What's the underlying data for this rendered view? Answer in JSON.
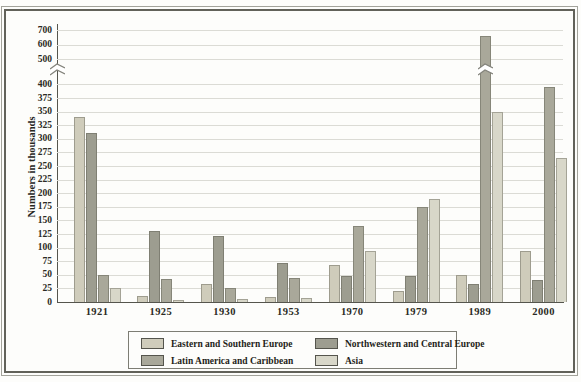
{
  "figure": {
    "ylabel": "Numbers in thousands"
  },
  "chart_data": {
    "type": "bar",
    "title": "",
    "xlabel": "",
    "ylabel": "Numbers in thousands",
    "categories": [
      "1921",
      "1925",
      "1930",
      "1953",
      "1970",
      "1979",
      "1989",
      "2000"
    ],
    "series": [
      {
        "name": "Eastern and Southern Europe",
        "color": "#cfccbb",
        "values": [
          340,
          12,
          34,
          10,
          68,
          20,
          50,
          93
        ]
      },
      {
        "name": "Northwestern and Central Europe",
        "color": "#9d9d90",
        "values": [
          311,
          130,
          121,
          72,
          48,
          48,
          33,
          40
        ]
      },
      {
        "name": "Latin America and Caribbean",
        "color": "#a9a89a",
        "values": [
          50,
          42,
          25,
          44,
          140,
          175,
          660,
          395
        ]
      },
      {
        "name": "Asia",
        "color": "#d8d7c9",
        "values": [
          25,
          4,
          5,
          8,
          94,
          190,
          350,
          265
        ]
      }
    ],
    "y_axis": {
      "ticks_below_break": [
        0,
        25,
        50,
        75,
        100,
        125,
        150,
        175,
        200,
        225,
        250,
        275,
        300,
        325,
        350,
        375,
        400
      ],
      "ticks_above_break": [
        500,
        600,
        700
      ],
      "break_between": [
        400,
        500
      ],
      "ylim": [
        0,
        700
      ]
    },
    "broken_bars": [
      {
        "category": "1989",
        "series": "Latin America and Caribbean"
      }
    ],
    "legend_position": "bottom",
    "grid": true
  }
}
